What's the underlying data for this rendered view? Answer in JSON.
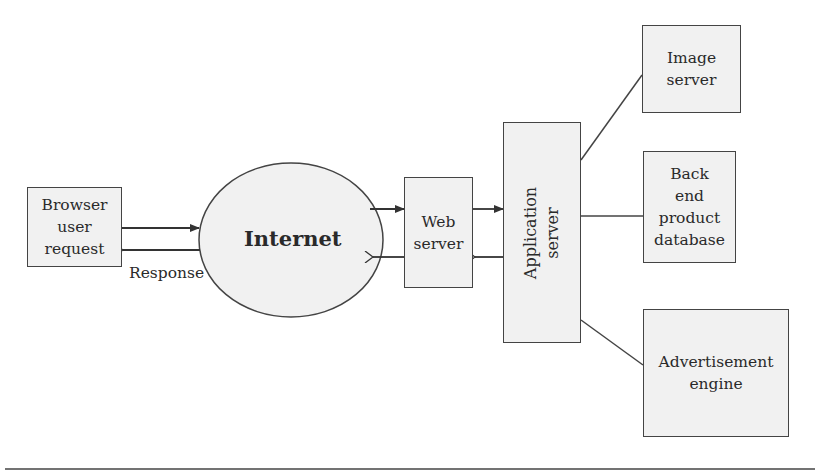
{
  "diagram": {
    "nodes": {
      "browser": {
        "label": "Browser\nuser\nrequest",
        "shape": "rectangle"
      },
      "internet": {
        "label": "Internet",
        "shape": "ellipse"
      },
      "web_server": {
        "label": "Web\nserver",
        "shape": "rectangle"
      },
      "application_server": {
        "label": "Application server",
        "shape": "rectangle",
        "orientation": "vertical"
      },
      "image_server": {
        "label": "Image\nserver",
        "shape": "rectangle"
      },
      "backend_db": {
        "label": "Back\nend\nproduct\ndatabase",
        "shape": "rectangle"
      },
      "ad_engine": {
        "label": "Advertisement\nengine",
        "shape": "rectangle"
      }
    },
    "edge_labels": {
      "response": "Response"
    },
    "edges": [
      {
        "from": "browser",
        "to": "internet",
        "type": "arrow"
      },
      {
        "from": "internet",
        "to": "browser",
        "type": "arrow",
        "label": "Response"
      },
      {
        "from": "internet",
        "to": "web_server",
        "type": "arrow"
      },
      {
        "from": "web_server",
        "to": "internet",
        "type": "arrow"
      },
      {
        "from": "web_server",
        "to": "application_server",
        "type": "arrow"
      },
      {
        "from": "application_server",
        "to": "web_server",
        "type": "arrow"
      },
      {
        "from": "application_server",
        "to": "image_server",
        "type": "line"
      },
      {
        "from": "application_server",
        "to": "backend_db",
        "type": "line"
      },
      {
        "from": "application_server",
        "to": "ad_engine",
        "type": "line"
      }
    ],
    "colors": {
      "stroke": "#444444",
      "fill": "#f1f1f1",
      "text": "#2a2a2a"
    }
  }
}
